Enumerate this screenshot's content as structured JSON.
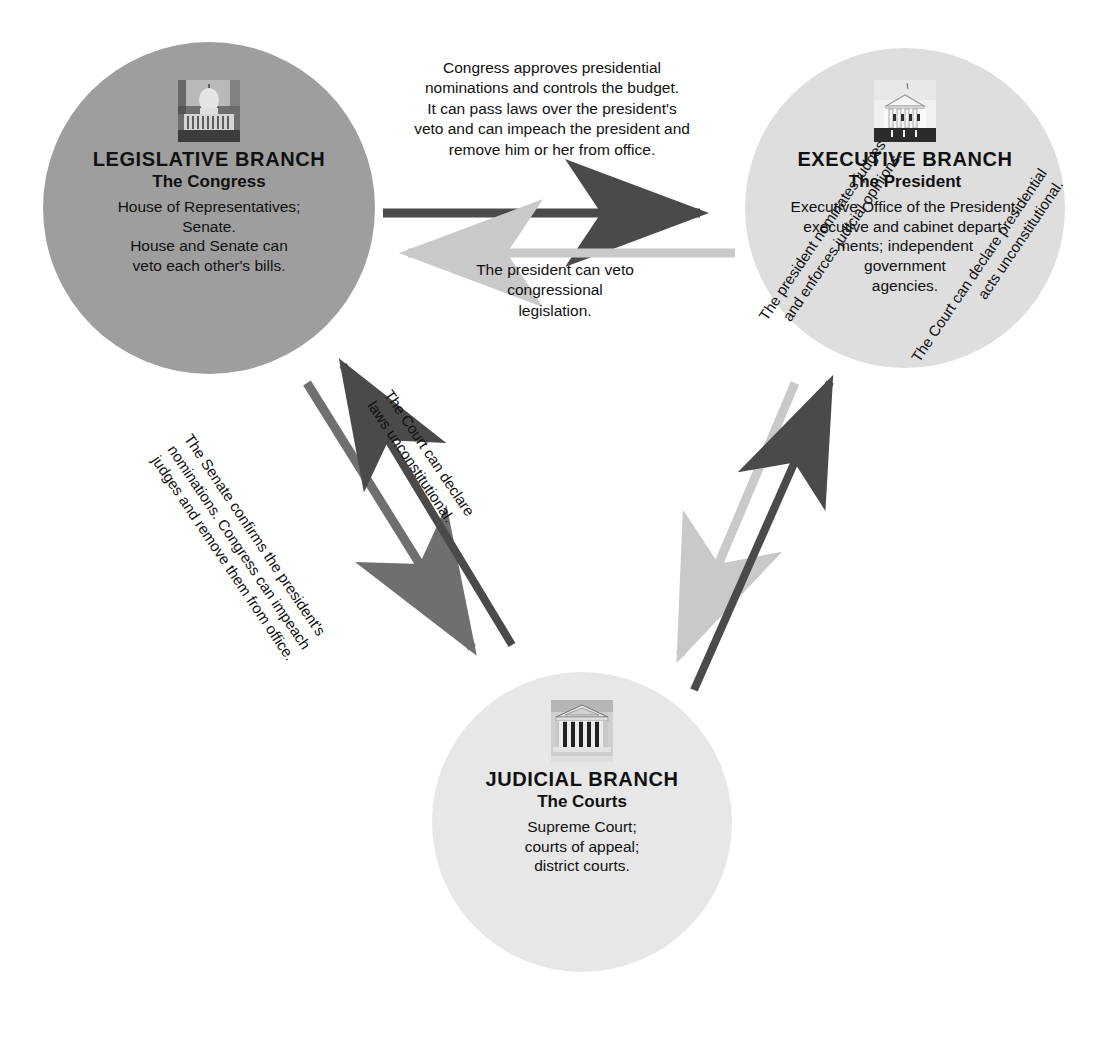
{
  "diagram": {
    "colors": {
      "legislative_fill": "#9e9e9e",
      "executive_fill": "#dedede",
      "judicial_fill": "#e7e7e7",
      "arrow_dark": "#4a4a4a",
      "arrow_medium": "#6f6f6f",
      "arrow_light": "#c9c9c9",
      "text": "#111111",
      "background": "#ffffff"
    }
  },
  "branches": {
    "legislative": {
      "title": "LEGISLATIVE BRANCH",
      "subtitle": "The Congress",
      "description": "House of Representatives;\nSenate.\nHouse and Senate can\nveto each other's bills.",
      "icon": "capitol-building-photo"
    },
    "executive": {
      "title": "EXECUTIVE BRANCH",
      "subtitle": "The President",
      "description": "Executive Office of the President;\nexecutive and cabinet depart-\nments; independent\ngovernment\nagencies.",
      "icon": "white-house-photo"
    },
    "judicial": {
      "title": "JUDICIAL BRANCH",
      "subtitle": "The Courts",
      "description": "Supreme Court;\ncourts of appeal;\ndistrict courts.",
      "icon": "supreme-court-building-photo"
    }
  },
  "connectors": {
    "congress_to_president": {
      "text": "Congress approves presidential\nnominations and controls the budget.\nIt can pass laws over the president's\nveto and can impeach the president and\nremove him or her from office.",
      "from": "legislative",
      "to": "executive",
      "color": "#4a4a4a"
    },
    "president_to_congress": {
      "text": "The president can veto\ncongressional\nlegislation.",
      "from": "executive",
      "to": "legislative",
      "color": "#c9c9c9"
    },
    "senate_to_courts": {
      "text": "The Senate confirms the president's\nnominations. Congress can impeach\njudges and remove them from office.",
      "from": "legislative",
      "to": "judicial",
      "color": "#6f6f6f"
    },
    "court_to_congress": {
      "text": "The Court can declare\nlaws unconstitutional.",
      "from": "judicial",
      "to": "legislative",
      "color": "#4a4a4a"
    },
    "president_to_courts": {
      "text": "The president nominates judges\nand enforces judicial opinions.",
      "from": "executive",
      "to": "judicial",
      "color": "#c9c9c9"
    },
    "court_to_president": {
      "text": "The Court can declare presidential\nacts unconstitutional.",
      "from": "judicial",
      "to": "executive",
      "color": "#4a4a4a"
    }
  }
}
